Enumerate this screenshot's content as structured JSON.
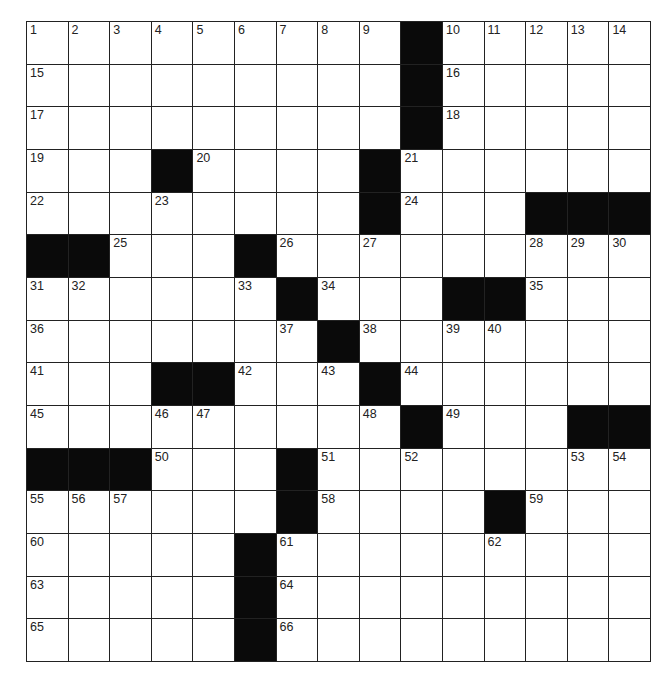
{
  "puzzle": {
    "rows": 15,
    "cols": 15,
    "grid": [
      "WWWWWWWWWBWWWWW",
      "WWWWWWWWWBWWWWW",
      "WWWWWWWWWBWWWWW",
      "WWWBWWWWBWWWWWW",
      "WWWWWWWWBWWWBBB",
      "BBWWWBWWWWWWWWW",
      "WWWWWWBWWWBBWWW",
      "WWWWWWWBWWWWWWW",
      "WWWBBWWWBWWWWWW",
      "WWWWWWWWWBWWWBB",
      "BBBWWWBWWWWWWWW",
      "WWWWWWBWWWWBWWW",
      "WWWWWBWWWWWWWWW",
      "WWWWWBWWWWWWWWW",
      "WWWWWBWWWWWWWWW"
    ],
    "numbers": {
      "0,0": "1",
      "0,1": "2",
      "0,2": "3",
      "0,3": "4",
      "0,4": "5",
      "0,5": "6",
      "0,6": "7",
      "0,7": "8",
      "0,8": "9",
      "0,10": "10",
      "0,11": "11",
      "0,12": "12",
      "0,13": "13",
      "0,14": "14",
      "1,0": "15",
      "1,10": "16",
      "2,0": "17",
      "2,10": "18",
      "3,0": "19",
      "3,4": "20",
      "3,9": "21",
      "4,0": "22",
      "4,3": "23",
      "4,9": "24",
      "5,2": "25",
      "5,6": "26",
      "5,8": "27",
      "5,12": "28",
      "5,13": "29",
      "5,14": "30",
      "6,0": "31",
      "6,1": "32",
      "6,5": "33",
      "6,7": "34",
      "6,12": "35",
      "7,0": "36",
      "7,6": "37",
      "7,8": "38",
      "7,10": "39",
      "7,11": "40",
      "8,0": "41",
      "8,5": "42",
      "8,7": "43",
      "8,9": "44",
      "9,0": "45",
      "9,3": "46",
      "9,4": "47",
      "9,8": "48",
      "9,10": "49",
      "10,3": "50",
      "10,7": "51",
      "10,9": "52",
      "10,13": "53",
      "10,14": "54",
      "11,0": "55",
      "11,1": "56",
      "11,2": "57",
      "11,7": "58",
      "11,12": "59",
      "12,0": "60",
      "12,6": "61",
      "12,11": "62",
      "13,0": "63",
      "13,6": "64",
      "14,0": "65",
      "14,6": "66"
    },
    "colors": {
      "block": "#0a0a0a",
      "cell": "#ffffff",
      "line": "#222222"
    }
  }
}
